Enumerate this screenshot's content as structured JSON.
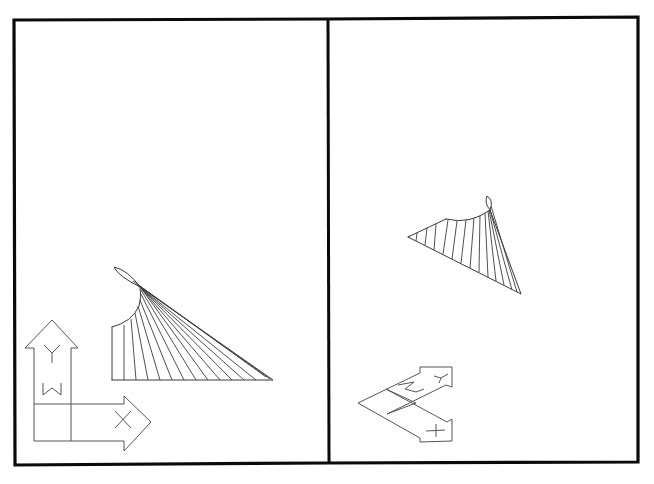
{
  "drawing": {
    "type": "cad-viewports",
    "colors": {
      "frame": "#0a0a0a",
      "geometry": "#3a3a3a",
      "ucs_icon": "#555555",
      "background": "#ffffff"
    },
    "viewports": [
      {
        "id": "left",
        "view": "plan",
        "ucs_icon": {
          "axes": [
            "Y",
            "X"
          ],
          "marker": "W"
        },
        "geometry": {
          "shape": "ruled-surface-fan",
          "fan_lines": 14
        }
      },
      {
        "id": "right",
        "view": "rotated",
        "ucs_icon": {
          "axes": [
            "Y",
            "X"
          ],
          "marker": "W"
        },
        "geometry": {
          "shape": "ruled-surface-fan",
          "fan_lines": 13
        }
      }
    ]
  },
  "labels": {
    "left_y_axis": "Y",
    "left_x_axis": "X",
    "left_marker": "W",
    "right_y_axis": "Y",
    "right_x_axis": "X",
    "right_marker": "W"
  }
}
